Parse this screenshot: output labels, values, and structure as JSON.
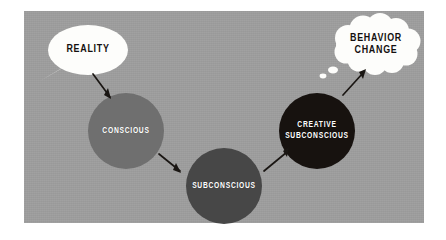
{
  "canvas": {
    "width": 446,
    "height": 240,
    "background": "#ffffff"
  },
  "panel": {
    "background": "#9d9d9d",
    "x": 24,
    "y": 11,
    "width": 400,
    "height": 212
  },
  "diagram": {
    "type": "flow",
    "title": "",
    "orientation": "left-to-right",
    "nodes": [
      {
        "id": "reality",
        "label": "REALITY",
        "shape": "speech-bubble",
        "fill": "#fdfdfb",
        "text_color": "#14100f",
        "cx": 88,
        "cy": 50,
        "rx": 40,
        "ry": 25,
        "tail": "lower-left"
      },
      {
        "id": "conscious",
        "label": "CONSCIOUS",
        "shape": "circle",
        "fill": "#6f6f6f",
        "text_color": "#ffffff",
        "cx": 126,
        "cy": 131,
        "r": 38
      },
      {
        "id": "subconscious",
        "label": "SUBCONSCIOUS",
        "shape": "circle",
        "fill": "#474747",
        "text_color": "#ffffff",
        "cx": 224,
        "cy": 186,
        "r": 38
      },
      {
        "id": "creative-subconscious",
        "label": "CREATIVE\nSUBCONSCIOUS",
        "shape": "circle",
        "fill": "#17120f",
        "text_color": "#ffffff",
        "cx": 317,
        "cy": 131,
        "r": 38
      },
      {
        "id": "behavior-change",
        "label": "BEHAVIOR\nCHANGE",
        "shape": "thought-cloud",
        "fill": "#fdfdfb",
        "text_color": "#14100f",
        "cx": 376,
        "cy": 45,
        "rx": 44,
        "ry": 26,
        "tail": "lower-left-dots"
      }
    ],
    "edges": [
      {
        "id": "reality-to-conscious",
        "from": "reality",
        "to": "conscious",
        "style": "arrow",
        "color": "#1a1613",
        "direction": "down-right"
      },
      {
        "id": "conscious-to-subconscious",
        "from": "conscious",
        "to": "subconscious",
        "style": "arrow",
        "color": "#1a1613",
        "direction": "down-right"
      },
      {
        "id": "subconscious-to-creative",
        "from": "subconscious",
        "to": "creative-subconscious",
        "style": "arrow",
        "color": "#1a1613",
        "direction": "up-right"
      },
      {
        "id": "creative-to-behavior",
        "from": "creative-subconscious",
        "to": "behavior-change",
        "style": "arrow",
        "color": "#1a1613",
        "direction": "up-right"
      }
    ]
  }
}
